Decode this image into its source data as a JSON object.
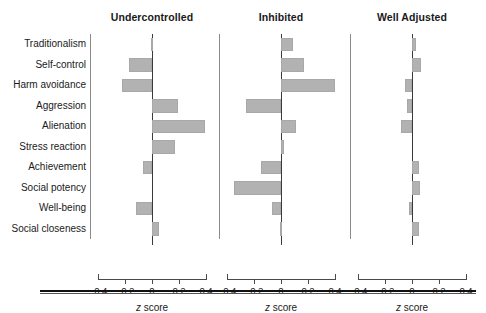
{
  "figure": {
    "axis_title": "z score",
    "axis_title_italic_part": "z",
    "axis_title_rest": " score"
  },
  "categories": [
    "Traditionalism",
    "Self-control",
    "Harm avoidance",
    "Aggression",
    "Alienation",
    "Stress reaction",
    "Achievement",
    "Social potency",
    "Well-being",
    "Social closeness"
  ],
  "panels": [
    {
      "title": "Undercontrolled"
    },
    {
      "title": "Inhibited"
    },
    {
      "title": "Well Adjusted"
    }
  ],
  "xticks": [
    "-0.4",
    "-0.2",
    "0",
    "0.2",
    "0.4"
  ],
  "xtick_values": [
    -0.4,
    -0.2,
    0,
    0.2,
    0.4
  ],
  "colors": {
    "bar_fill": "#b2b2b2",
    "bar_edge": "#a8a8a8",
    "zero_line": "#3a3a3a",
    "axis": "#4a4a4a",
    "text": "#1a1a1a",
    "rule": "#111111"
  },
  "chart_data": {
    "type": "bar",
    "orientation": "horizontal",
    "title": "",
    "subtitle": "",
    "xlabel": "z score",
    "ylabel": "",
    "xlim": [
      -0.5,
      0.5
    ],
    "grid": false,
    "legend": "none",
    "panel_layout": "1x3 shared y-axis",
    "categories": [
      "Traditionalism",
      "Self-control",
      "Harm avoidance",
      "Aggression",
      "Alienation",
      "Stress reaction",
      "Achievement",
      "Social potency",
      "Well-being",
      "Social closeness"
    ],
    "xticks": [
      -0.4,
      -0.2,
      0,
      0.2,
      0.4
    ],
    "series": [
      {
        "name": "Undercontrolled",
        "values": [
          -0.01,
          -0.17,
          -0.22,
          0.19,
          0.39,
          0.17,
          -0.07,
          0.0,
          -0.12,
          0.05
        ]
      },
      {
        "name": "Inhibited",
        "values": [
          0.09,
          0.17,
          0.4,
          -0.26,
          0.11,
          0.02,
          -0.15,
          -0.35,
          -0.07,
          -0.01
        ]
      },
      {
        "name": "Well Adjusted",
        "values": [
          0.03,
          0.07,
          -0.05,
          -0.04,
          -0.08,
          0.0,
          0.05,
          0.06,
          -0.02,
          0.05
        ]
      }
    ]
  }
}
